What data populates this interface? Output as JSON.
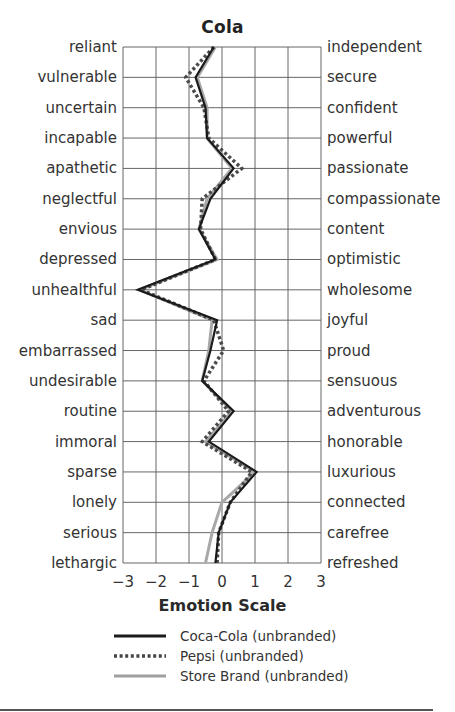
{
  "chart_data": {
    "type": "line",
    "title": "Cola",
    "xlabel": "Emotion Scale",
    "ylabel": "",
    "xlim": [
      -3,
      3
    ],
    "x_ticks": [
      "−3",
      "−2",
      "−1",
      "0",
      "1",
      "2",
      "3"
    ],
    "grid": true,
    "orientation": "horizontal-profile",
    "left_labels": [
      "reliant",
      "vulnerable",
      "uncertain",
      "incapable",
      "apathetic",
      "neglectful",
      "envious",
      "depressed",
      "unhealthful",
      "sad",
      "embarrassed",
      "undesirable",
      "routine",
      "immoral",
      "sparse",
      "lonely",
      "serious",
      "lethargic"
    ],
    "right_labels": [
      "independent",
      "secure",
      "confident",
      "powerful",
      "passionate",
      "compassionate",
      "content",
      "optimistic",
      "wholesome",
      "joyful",
      "proud",
      "sensuous",
      "adventurous",
      "honorable",
      "luxurious",
      "connected",
      "carefree",
      "refreshed"
    ],
    "series": [
      {
        "name": "Coca-Cola (unbranded)",
        "style": "solid",
        "color": "#1a1a1a",
        "values": [
          -0.25,
          -0.8,
          -0.5,
          -0.45,
          0.35,
          -0.35,
          -0.7,
          -0.2,
          -2.55,
          -0.15,
          -0.35,
          -0.6,
          0.35,
          -0.4,
          1.05,
          0.25,
          -0.1,
          -0.2
        ]
      },
      {
        "name": "Pepsi (unbranded)",
        "style": "dotted",
        "color": "#555555",
        "values": [
          -0.25,
          -1.1,
          -0.55,
          -0.4,
          0.6,
          -0.6,
          -0.65,
          -0.2,
          -2.45,
          -0.25,
          0.05,
          -0.55,
          0.2,
          -0.6,
          0.9,
          0.25,
          -0.1,
          -0.15
        ]
      },
      {
        "name": "Store Brand (unbranded)",
        "style": "solid-light",
        "color": "#a0a0a0",
        "values": [
          -0.2,
          -0.75,
          -0.45,
          -0.45,
          0.3,
          -0.45,
          -0.7,
          -0.15,
          -2.5,
          -0.3,
          -0.4,
          -0.6,
          0.3,
          -0.5,
          1.0,
          0.0,
          -0.3,
          -0.5
        ]
      }
    ],
    "legend_position": "bottom"
  }
}
